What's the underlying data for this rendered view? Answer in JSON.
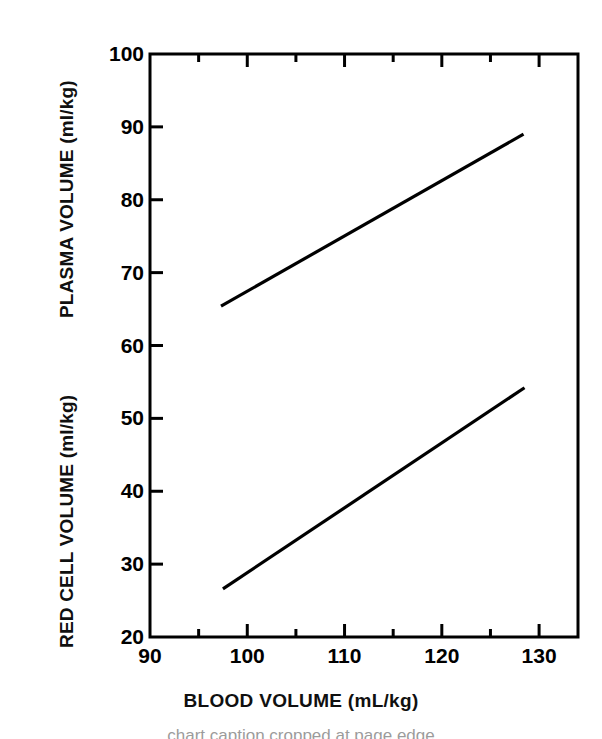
{
  "figure": {
    "background_color": "#ffffff",
    "ink_color": "#000000",
    "caption_remnant": "chart caption cropped at page edge"
  },
  "chart_data": {
    "type": "line",
    "title": "",
    "xlabel": "BLOOD VOLUME (mL/kg)",
    "ylabel_primary": "PLASMA VOLUME (ml/kg)",
    "ylabel_secondary": "RED CELL VOLUME (ml/kg)",
    "xlim": [
      90,
      134
    ],
    "ylim": [
      20,
      100
    ],
    "grid": false,
    "legend": "none",
    "x_ticks_major": [
      90,
      100,
      110,
      120,
      130
    ],
    "x_ticks_minor": [
      95,
      105,
      115,
      125
    ],
    "x_tick_labels": [
      "90",
      "100",
      "110",
      "120",
      "130"
    ],
    "y_ticks_major": [
      20,
      30,
      40,
      50,
      60,
      70,
      80,
      90,
      100
    ],
    "y_tick_labels": [
      "20",
      "30",
      "40",
      "50",
      "60",
      "70",
      "80",
      "90",
      "100"
    ],
    "y_labels_upper_range": [
      "60",
      "70",
      "80",
      "90",
      "100"
    ],
    "y_labels_lower_range": [
      "20",
      "30",
      "40",
      "50"
    ],
    "series": [
      {
        "name": "PLASMA VOLUME (ml/kg)",
        "axis": "upper",
        "style": "solid-line",
        "color": "#000000",
        "x": [
          97.3,
          128.4
        ],
        "values": [
          65.4,
          89.0
        ]
      },
      {
        "name": "RED CELL VOLUME (ml/kg)",
        "axis": "lower",
        "style": "solid-line",
        "color": "#000000",
        "x": [
          97.5,
          128.5
        ],
        "values": [
          26.6,
          54.2
        ]
      }
    ]
  },
  "axes": {
    "y_ticks": [
      {
        "value": "100",
        "pos": 54
      },
      {
        "value": "90",
        "pos": 127
      },
      {
        "value": "80",
        "pos": 200
      },
      {
        "value": "70",
        "pos": 272
      },
      {
        "value": "60",
        "pos": 345
      },
      {
        "value": "50",
        "pos": 418
      },
      {
        "value": "40",
        "pos": 491
      },
      {
        "value": "30",
        "pos": 564
      },
      {
        "value": "20",
        "pos": 637
      }
    ],
    "x_ticks": [
      {
        "value": "90",
        "pos": 150
      },
      {
        "value": "100",
        "pos": 247
      },
      {
        "value": "110",
        "pos": 345
      },
      {
        "value": "120",
        "pos": 442
      },
      {
        "value": "130",
        "pos": 539
      }
    ]
  }
}
